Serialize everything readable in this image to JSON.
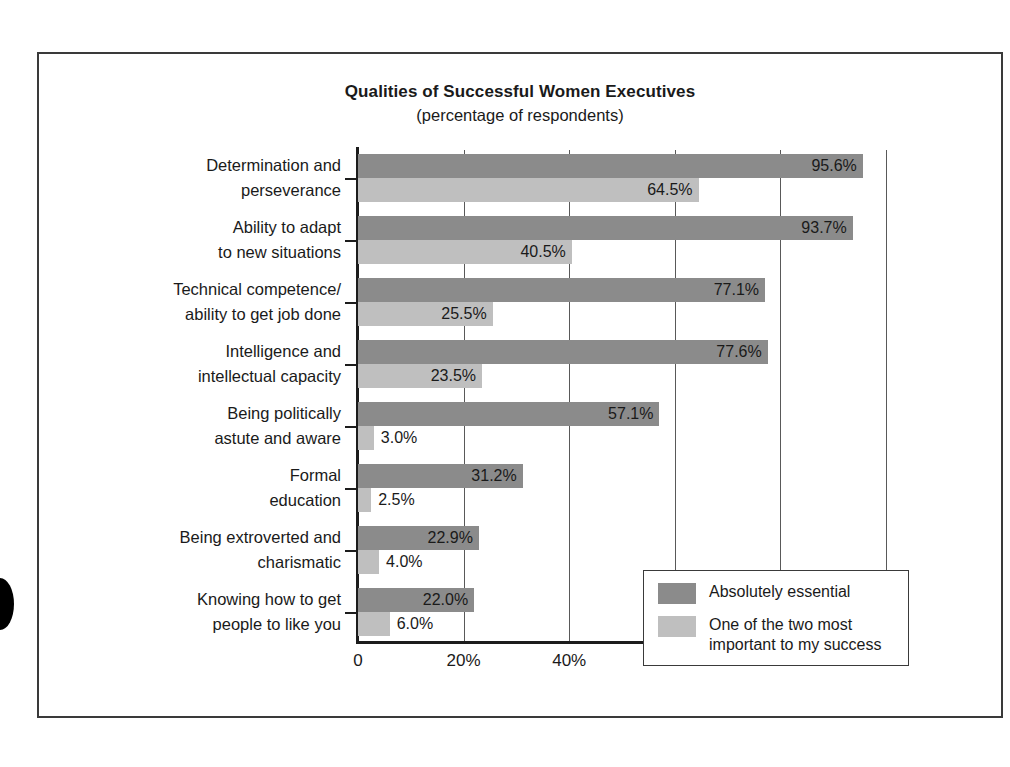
{
  "chart_data": {
    "type": "bar",
    "orientation": "horizontal",
    "title": "Qualities of Successful Women Executives",
    "subtitle": "(percentage of respondents)",
    "xlabel": "",
    "ylabel": "",
    "xlim": [
      0,
      100
    ],
    "xticks": [
      "0",
      "20%",
      "40%",
      "60%",
      "80%",
      "100%"
    ],
    "xtick_values": [
      0,
      20,
      40,
      60,
      80,
      100
    ],
    "grid": true,
    "legend_position": "inside-lower-right",
    "categories": [
      "Determination and perseverance",
      "Ability to adapt to new situations",
      "Technical competence/ability to get job done",
      "Intelligence and intellectual capacity",
      "Being politically astute and aware",
      "Formal education",
      "Being extroverted and charismatic",
      "Knowing how to get people to like you"
    ],
    "category_lines": [
      [
        "Determination and",
        "perseverance"
      ],
      [
        "Ability to adapt",
        "to new situations"
      ],
      [
        "Technical competence/",
        "ability to get job done"
      ],
      [
        "Intelligence and",
        "intellectual capacity"
      ],
      [
        "Being politically",
        "astute and aware"
      ],
      [
        "Formal",
        "education"
      ],
      [
        "Being extroverted and",
        "charismatic"
      ],
      [
        "Knowing how to get",
        "people to like you"
      ]
    ],
    "series": [
      {
        "name": "Absolutely essential",
        "color": "#8b8b8b",
        "values": [
          95.6,
          93.7,
          77.1,
          77.6,
          57.1,
          31.2,
          22.9,
          22.0
        ],
        "labels": [
          "95.6%",
          "93.7%",
          "77.1%",
          "77.6%",
          "57.1%",
          "31.2%",
          "22.9%",
          "22.0%"
        ]
      },
      {
        "name": "One of the two most important to my success",
        "color": "#bfbfbf",
        "values": [
          64.5,
          40.5,
          25.5,
          23.5,
          3.0,
          2.5,
          4.0,
          6.0
        ],
        "labels": [
          "64.5%",
          "40.5%",
          "25.5%",
          "23.5%",
          "3.0%",
          "2.5%",
          "4.0%",
          "6.0%"
        ]
      }
    ]
  },
  "legend": {
    "items": [
      {
        "label": "Absolutely essential",
        "lines": [
          "Absolutely essential"
        ]
      },
      {
        "label": "One of the two most important to my success",
        "lines": [
          "One of the two most",
          "important to my success"
        ]
      }
    ]
  },
  "colors": {
    "essential": "#8b8b8b",
    "top_two": "#bfbfbf",
    "axis": "#1c1c1c",
    "grid": "#595959",
    "frame": "#3a3a3a",
    "text": "#1a1a1a",
    "background": "#ffffff"
  }
}
